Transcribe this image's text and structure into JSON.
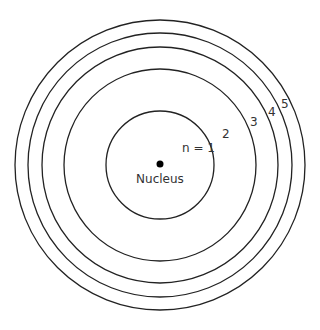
{
  "diagram": {
    "center": {
      "x": 160,
      "y": 165
    },
    "nucleus": {
      "label": "Nucleus",
      "dot_radius": 3.5
    },
    "orbits": [
      {
        "n": 1,
        "label": "n = 1",
        "radius": 54,
        "label_x": 182,
        "label_y": 151
      },
      {
        "n": 2,
        "label": "2",
        "radius": 96,
        "label_x": 225,
        "label_y": 137
      },
      {
        "n": 3,
        "label": "3",
        "radius": 118,
        "label_x": 250,
        "label_y": 125
      },
      {
        "n": 4,
        "label": "4",
        "radius": 132,
        "label_x": 268,
        "label_y": 114
      },
      {
        "n": 5,
        "label": "5",
        "radius": 145,
        "label_x": 281,
        "label_y": 107
      }
    ],
    "colors": {
      "stroke": "#222222",
      "text": "#333333",
      "background": "#ffffff"
    }
  }
}
